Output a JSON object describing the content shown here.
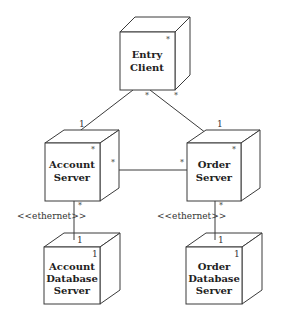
{
  "diagram": {
    "type": "UML deployment diagram",
    "nodes": [
      {
        "id": "entry-client",
        "label_lines": [
          "Entry",
          "Client"
        ],
        "multiplicity": "*"
      },
      {
        "id": "account-server",
        "label_lines": [
          "Account",
          "Server"
        ],
        "multiplicity": "*"
      },
      {
        "id": "order-server",
        "label_lines": [
          "Order",
          "Server"
        ],
        "multiplicity": "*"
      },
      {
        "id": "account-db-server",
        "label_lines": [
          "Account",
          "Database",
          "Server"
        ],
        "multiplicity": "1"
      },
      {
        "id": "order-db-server",
        "label_lines": [
          "Order",
          "Database",
          "Server"
        ],
        "multiplicity": "1"
      }
    ],
    "connections": [
      {
        "from": "entry-client",
        "to": "account-server",
        "from_mult": "*",
        "to_mult": "1",
        "stereotype": ""
      },
      {
        "from": "entry-client",
        "to": "order-server",
        "from_mult": "*",
        "to_mult": "1",
        "stereotype": ""
      },
      {
        "from": "account-server",
        "to": "order-server",
        "from_mult": "*",
        "to_mult": "*",
        "stereotype": ""
      },
      {
        "from": "account-server",
        "to": "account-db-server",
        "from_mult": "*",
        "to_mult": "1",
        "stereotype": "<<ethernet>>"
      },
      {
        "from": "order-server",
        "to": "order-db-server",
        "from_mult": "*",
        "to_mult": "1",
        "stereotype": "<<ethernet>>"
      }
    ]
  }
}
